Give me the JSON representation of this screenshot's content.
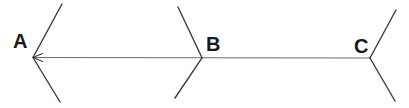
{
  "figure": {
    "canvas": {
      "width": 409,
      "height": 108,
      "background": "#ffffff"
    },
    "colors": {
      "baseline": "#6e6e6e",
      "fin": "#3d3d3d",
      "label": "#1a1a1a"
    },
    "labels": [
      {
        "id": "point-label-a",
        "text": "A",
        "x": 13,
        "y": 48,
        "font_size": 20
      },
      {
        "id": "point-label-b",
        "text": "B",
        "x": 206,
        "y": 51,
        "font_size": 20
      },
      {
        "id": "point-label-c",
        "text": "C",
        "x": 354,
        "y": 53,
        "font_size": 20
      }
    ],
    "baseline": {
      "id": "baseline-a-to-c",
      "x1": 33,
      "y1": 57.5,
      "x2": 370,
      "y2": 58,
      "width": 1.1
    },
    "arrowhead_at_a": {
      "tip": [
        33,
        57.5
      ],
      "wing_upper": [
        42.5,
        53.5
      ],
      "wing_lower": [
        42.5,
        61.5
      ],
      "width": 1.1
    },
    "fins": [
      {
        "id": "fin-a-upper",
        "x1": 33,
        "y1": 57.5,
        "x2": 62,
        "y2": 4
      },
      {
        "id": "fin-a-lower",
        "x1": 33,
        "y1": 57.5,
        "x2": 60,
        "y2": 102
      },
      {
        "id": "fin-b-upper",
        "x1": 202,
        "y1": 57.8,
        "x2": 178,
        "y2": 7
      },
      {
        "id": "fin-b-lower",
        "x1": 202,
        "y1": 57.8,
        "x2": 175,
        "y2": 98
      },
      {
        "id": "fin-c-upper",
        "x1": 370,
        "y1": 58,
        "x2": 396,
        "y2": 10
      },
      {
        "id": "fin-c-lower",
        "x1": 370,
        "y1": 58,
        "x2": 395,
        "y2": 101
      }
    ],
    "fin_stroke_width": 1.4
  }
}
